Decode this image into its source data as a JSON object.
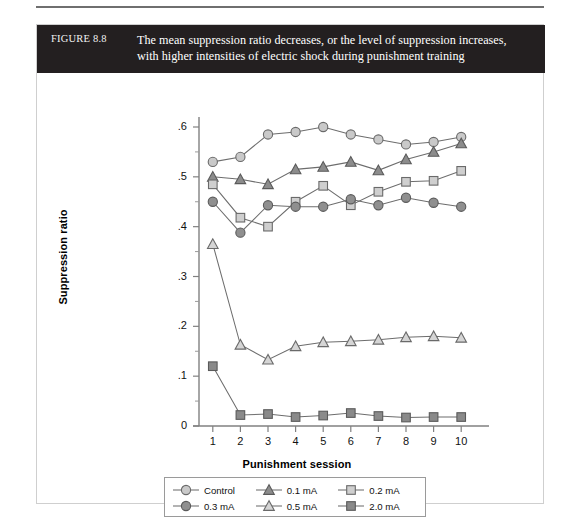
{
  "figure": {
    "label": "FIGURE 8.8",
    "caption_line1": "The mean suppression ratio decreases, or the level of suppression increases,",
    "caption_line2": "with higher intensities of electric shock during punishment training",
    "caption_bg": "#231f20",
    "caption_fg": "#ffffff"
  },
  "chart_data": {
    "type": "line",
    "title": "The mean suppression ratio decreases, or the level of suppression increases, with higher intensities of electric shock during punishment training",
    "xlabel": "Punishment session",
    "ylabel": "Suppression ratio",
    "x": [
      1,
      2,
      3,
      4,
      5,
      6,
      7,
      8,
      9,
      10
    ],
    "xticklabels": [
      "1",
      "2",
      "3",
      "4",
      "5",
      "6",
      "7",
      "8",
      "9",
      "10"
    ],
    "yticklabels": [
      "0",
      ".1",
      ".2",
      ".3",
      ".4",
      ".5",
      ".6"
    ],
    "yticks": [
      0,
      0.1,
      0.2,
      0.3,
      0.4,
      0.5,
      0.6
    ],
    "xlim": [
      0.5,
      10.5
    ],
    "ylim": [
      0,
      0.6
    ],
    "grid": false,
    "legend_position": "below-axes",
    "series": [
      {
        "name": "Control",
        "marker": "circle-open",
        "color": "#c9c9c9",
        "edge": "#6a6a6a",
        "values": [
          0.53,
          0.54,
          0.585,
          0.59,
          0.6,
          0.585,
          0.575,
          0.565,
          0.57,
          0.58
        ]
      },
      {
        "name": "0.1 mA",
        "marker": "triangle-filled",
        "color": "#8c8c8c",
        "edge": "#5a5a5a",
        "values": [
          0.5,
          0.495,
          0.485,
          0.515,
          0.52,
          0.53,
          0.513,
          0.535,
          0.55,
          0.567
        ]
      },
      {
        "name": "0.2 mA",
        "marker": "square-open",
        "color": "#cfcfcf",
        "edge": "#6a6a6a",
        "values": [
          0.485,
          0.418,
          0.4,
          0.45,
          0.482,
          0.443,
          0.47,
          0.49,
          0.492,
          0.512
        ]
      },
      {
        "name": "0.3 mA",
        "marker": "circle-filled",
        "color": "#8f8f8f",
        "edge": "#5a5a5a",
        "values": [
          0.45,
          0.388,
          0.443,
          0.44,
          0.44,
          0.455,
          0.443,
          0.458,
          0.448,
          0.44
        ]
      },
      {
        "name": "0.5 mA",
        "marker": "triangle-open",
        "color": "#d5d5d5",
        "edge": "#6a6a6a",
        "values": [
          0.365,
          0.163,
          0.133,
          0.16,
          0.168,
          0.17,
          0.173,
          0.178,
          0.18,
          0.177
        ]
      },
      {
        "name": "2.0 mA",
        "marker": "square-filled",
        "color": "#8a8a8a",
        "edge": "#5a5a5a",
        "values": [
          0.12,
          0.022,
          0.024,
          0.018,
          0.021,
          0.026,
          0.02,
          0.017,
          0.018,
          0.018
        ]
      }
    ]
  }
}
